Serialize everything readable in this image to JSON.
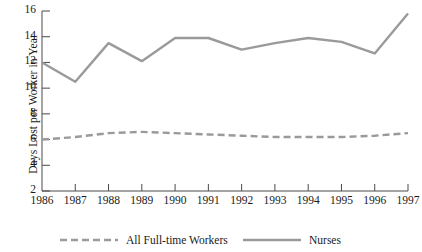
{
  "chart_data": {
    "type": "line",
    "title": "",
    "xlabel": "",
    "ylabel": "Days Lost per Worker in Year",
    "x": [
      "1986",
      "1987",
      "1988",
      "1989",
      "1990",
      "1991",
      "1992",
      "1993",
      "1994",
      "1995",
      "1996",
      "1997"
    ],
    "xlim": [
      "1986",
      "1997"
    ],
    "ylim": [
      2,
      16
    ],
    "yticks": [
      2,
      4,
      6,
      8,
      10,
      12,
      14,
      16
    ],
    "ytick_labels": [
      "2",
      "4",
      "6",
      "8",
      "10",
      "12",
      "14",
      "16"
    ],
    "grid": false,
    "legend_position": "bottom",
    "series": [
      {
        "name": "All Full-time Workers",
        "style": "dashed",
        "color": "#9a9a9a",
        "values": [
          6.0,
          6.2,
          6.5,
          6.6,
          6.5,
          6.4,
          6.3,
          6.2,
          6.2,
          6.2,
          6.3,
          6.5
        ]
      },
      {
        "name": "Nurses",
        "style": "solid",
        "color": "#9a9a9a",
        "values": [
          12.0,
          10.5,
          13.5,
          12.1,
          13.9,
          13.9,
          13.0,
          13.5,
          13.9,
          13.6,
          12.7,
          15.8
        ]
      }
    ]
  },
  "axis": {
    "y_title": "Days Lost per Worker in Year"
  },
  "legend": {
    "entries": [
      {
        "label": "All Full-time Workers",
        "style": "dashed"
      },
      {
        "label": "Nurses",
        "style": "solid"
      }
    ]
  },
  "colors": {
    "line": "#9a9a9a",
    "axis": "#4a4a4a",
    "text": "#1a1a1a",
    "background": "#ffffff"
  }
}
